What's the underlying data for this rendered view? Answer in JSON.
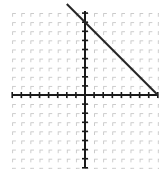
{
  "figure": {
    "name": "coordinate-plane-with-line",
    "background_color": "#ffffff",
    "grid_color": "#c8c8c8",
    "axis_color": "#1a1a1a",
    "line_color": "#262626"
  },
  "chart_data": {
    "type": "line",
    "title": "",
    "xlabel": "",
    "ylabel": "",
    "xlim": [
      -8,
      8
    ],
    "ylim": [
      -8,
      9
    ],
    "grid": true,
    "grid_style": "dashed",
    "legend": "none",
    "xticks": [
      -8,
      -7,
      -6,
      -5,
      -4,
      -3,
      -2,
      -1,
      0,
      1,
      2,
      3,
      4,
      5,
      6,
      7,
      8
    ],
    "yticks": [
      -8,
      -7,
      -6,
      -5,
      -4,
      -3,
      -2,
      -1,
      0,
      1,
      2,
      3,
      4,
      5,
      6,
      7,
      8,
      9
    ],
    "xtick_labels": [],
    "ytick_labels": [],
    "axes": {
      "x_axis_y_value": 0,
      "y_axis_x_value": 0,
      "show_x_axis": true,
      "show_y_axis": true
    },
    "series": [
      {
        "name": "line",
        "slope": -1,
        "intercept": 8,
        "equation": "y = -x + 8",
        "x": [
          -2,
          8
        ],
        "y": [
          10,
          0
        ],
        "x_intercept": 8,
        "y_intercept": 8,
        "style": "solid",
        "width": 2
      }
    ],
    "annotations": []
  },
  "geometry": {
    "origin_x_px": 85,
    "origin_y_px": 95,
    "cell_px": 9.1,
    "grid_left_px": 12,
    "grid_right_px": 158,
    "grid_top_px": 11,
    "grid_bottom_px": 168
  }
}
